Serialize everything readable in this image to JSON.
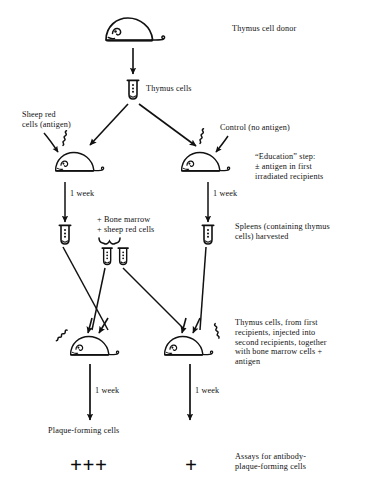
{
  "figure": {
    "title_alt": "Thymus cell education experiment flow diagram",
    "background": "#ffffff",
    "ink": "#111111"
  },
  "labels": {
    "thymus_cell_donor": "Thymus cell donor",
    "thymus_cells": "Thymus cells",
    "sheep_red_cells_antigen": "Sheep red\ncells (antigen)",
    "control_no_antigen": "Control (no antigen)",
    "education_step": "“Education” step:\n± antigen in first\nirradiated recipients",
    "one_week_1": "1 week",
    "one_week_2": "1 week",
    "one_week_3": "1 week",
    "one_week_4": "1 week",
    "bone_marrow_sheep_red_cells": "+ Bone marrow\n+ sheep red cells",
    "spleens_harvested": "Spleens (containing thymus\ncells) harvested",
    "thymus_cells_second_recipients": "Thymus cells, from first\nrecipients, injected into\nsecond recipients, together\nwith bone marrow cells +\nantigen",
    "plaque_forming_cells": "Plaque-forming cells",
    "assays_for_antibody": "Assays for antibody-\nplaque-forming cells",
    "result_left": "+++",
    "result_right": "+"
  },
  "icons": {
    "mouse_donor": "mouse-icon",
    "mouse_left_first_recipient": "mouse-icon",
    "mouse_right_first_recipient": "mouse-icon",
    "mouse_left_second_recipient": "mouse-icon",
    "mouse_right_second_recipient": "mouse-icon",
    "tube_thymus_cells": "test-tube-icon",
    "tube_left_spleen": "test-tube-icon",
    "tube_right_spleen": "test-tube-icon",
    "tube_mid_left": "test-tube-icon",
    "tube_mid_right": "test-tube-icon",
    "irradiation_left_first": "irradiation-squiggle-icon",
    "irradiation_right_first": "irradiation-squiggle-icon",
    "irradiation_left_second": "irradiation-squiggle-icon",
    "irradiation_right_second": "irradiation-squiggle-icon",
    "brace_bone_marrow": "curly-brace-icon"
  },
  "arrows": {
    "donor_to_tube": "arrow-down",
    "tube_split_left": "arrow-diagonal-down-left",
    "tube_split_right": "arrow-diagonal-down-right",
    "antigen_into_left_mouse": "arrow-down-right",
    "antigen_into_right_mouse": "arrow-down-left",
    "left_mouse_one_week": "arrow-down",
    "right_mouse_one_week": "arrow-down",
    "left_spleen_to_second": "line-diagonal",
    "right_spleen_to_second": "line-diagonal",
    "mid_tubes_to_second": "line-diagonal",
    "left_second_one_week": "arrow-down",
    "right_second_one_week": "arrow-down"
  }
}
